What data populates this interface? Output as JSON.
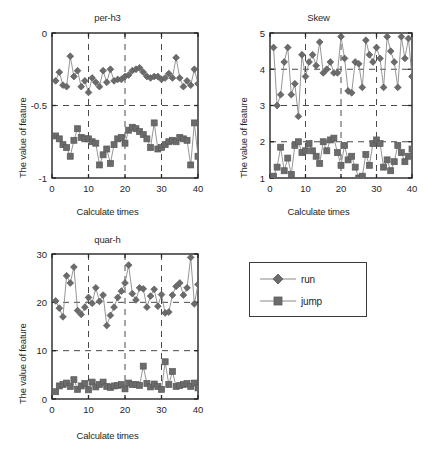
{
  "figure": {
    "background_color": "#ffffff",
    "series_color": "#6b6b6b",
    "line_color": "#8a8a8a",
    "axis_color": "#262626",
    "grid_color": "#4a4a4a"
  },
  "legend": {
    "name": "series-legend",
    "position": "bottom-right",
    "entries": [
      {
        "label": "run",
        "marker": "diamond-marker",
        "color": "#6b6b6b"
      },
      {
        "label": "jump",
        "marker": "square-marker",
        "color": "#6b6b6b"
      }
    ]
  },
  "chart_data": [
    {
      "type": "line",
      "panel": "per-h3",
      "title": "per-h3",
      "xlabel": "Calculate times",
      "ylabel": "The value of feature",
      "xlim": [
        0,
        40
      ],
      "ylim": [
        -1,
        0
      ],
      "xticks": [
        0,
        10,
        20,
        30,
        40
      ],
      "yticks": [
        0,
        -0.5,
        -1
      ],
      "xticklabels": [
        "0",
        "10",
        "20",
        "30",
        "40"
      ],
      "yticklabels": [
        "0",
        "-0.5",
        "-1"
      ],
      "grid": true,
      "grid_style": "dashed",
      "legend_position": "external",
      "x": [
        1,
        2,
        3,
        4,
        5,
        6,
        7,
        8,
        9,
        10,
        11,
        12,
        13,
        14,
        15,
        16,
        17,
        18,
        19,
        20,
        21,
        22,
        23,
        24,
        25,
        26,
        27,
        28,
        29,
        30,
        31,
        32,
        33,
        34,
        35,
        36,
        37,
        38,
        39,
        40
      ],
      "series": [
        {
          "name": "run",
          "marker": "diamond",
          "values": [
            -0.33,
            -0.27,
            -0.36,
            -0.37,
            -0.16,
            -0.3,
            -0.26,
            -0.37,
            -0.33,
            -0.41,
            -0.31,
            -0.34,
            -0.37,
            -0.26,
            -0.34,
            -0.25,
            -0.33,
            -0.32,
            -0.32,
            -0.3,
            -0.29,
            -0.26,
            -0.25,
            -0.24,
            -0.27,
            -0.3,
            -0.31,
            -0.3,
            -0.3,
            -0.32,
            -0.31,
            -0.28,
            -0.31,
            -0.17,
            -0.31,
            -0.37,
            -0.33,
            -0.36,
            -0.25,
            -0.35
          ]
        },
        {
          "name": "jump",
          "marker": "square",
          "values": [
            -0.71,
            -0.73,
            -0.77,
            -0.79,
            -0.85,
            -0.74,
            -0.66,
            -0.72,
            -0.73,
            -0.73,
            -0.75,
            -0.76,
            -0.91,
            -0.84,
            -0.8,
            -0.9,
            -0.77,
            -0.73,
            -0.72,
            -0.76,
            -0.67,
            -0.65,
            -0.66,
            -0.68,
            -0.7,
            -0.73,
            -0.79,
            -0.62,
            -0.8,
            -0.79,
            -0.77,
            -0.75,
            -0.74,
            -0.75,
            -0.72,
            -0.73,
            -0.74,
            -0.91,
            -0.62,
            -0.85
          ]
        }
      ]
    },
    {
      "type": "line",
      "panel": "Skew",
      "title": "Skew",
      "xlabel": "Calculate times",
      "ylabel": "The value of feature",
      "xlim": [
        0,
        40
      ],
      "ylim": [
        1,
        5
      ],
      "xticks": [
        0,
        10,
        20,
        30,
        40
      ],
      "yticks": [
        1,
        2,
        3,
        4,
        5
      ],
      "xticklabels": [
        "0",
        "10",
        "20",
        "30",
        "40"
      ],
      "yticklabels": [
        "1",
        "2",
        "3",
        "4",
        "5"
      ],
      "grid": true,
      "grid_style": "dashed",
      "legend_position": "external",
      "x": [
        1,
        2,
        3,
        4,
        5,
        6,
        7,
        8,
        9,
        10,
        11,
        12,
        13,
        14,
        15,
        16,
        17,
        18,
        19,
        20,
        21,
        22,
        23,
        24,
        25,
        26,
        27,
        28,
        29,
        30,
        31,
        32,
        33,
        34,
        35,
        36,
        37,
        38,
        39,
        40
      ],
      "series": [
        {
          "name": "run",
          "marker": "diamond",
          "values": [
            4.6,
            3.0,
            3.3,
            4.2,
            4.6,
            3.3,
            3.6,
            2.7,
            4.4,
            3.8,
            4.2,
            4.4,
            4.1,
            4.75,
            3.9,
            4.0,
            4.2,
            3.9,
            3.9,
            4.9,
            4.3,
            3.4,
            3.35,
            4.2,
            4.15,
            3.5,
            4.8,
            4.4,
            4.2,
            4.6,
            4.3,
            3.5,
            4.9,
            4.5,
            4.2,
            3.5,
            4.9,
            4.3,
            4.85,
            3.8
          ]
        },
        {
          "name": "jump",
          "marker": "square",
          "values": [
            1.05,
            1.3,
            1.85,
            1.2,
            1.55,
            1.1,
            1.9,
            2.0,
            1.7,
            1.75,
            1.95,
            1.75,
            1.6,
            1.4,
            2.0,
            1.75,
            2.05,
            2.1,
            1.7,
            1.35,
            1.9,
            1.5,
            1.6,
            1.3,
            1.0,
            1.05,
            1.65,
            1.35,
            1.95,
            2.05,
            1.95,
            1.3,
            1.5,
            1.2,
            1.45,
            1.9,
            1.7,
            1.45,
            1.6,
            1.8
          ]
        }
      ]
    },
    {
      "type": "line",
      "panel": "quar-h",
      "title": "quar-h",
      "xlabel": "Calculate times",
      "ylabel": "The value of feature",
      "xlim": [
        0,
        40
      ],
      "ylim": [
        0,
        30
      ],
      "xticks": [
        0,
        10,
        20,
        30,
        40
      ],
      "yticks": [
        0,
        10,
        20,
        30
      ],
      "xticklabels": [
        "0",
        "10",
        "20",
        "30",
        "40"
      ],
      "yticklabels": [
        "0",
        "10",
        "20",
        "30"
      ],
      "grid": true,
      "grid_style": "dashed",
      "legend_position": "external",
      "x": [
        1,
        2,
        3,
        4,
        5,
        6,
        7,
        8,
        9,
        10,
        11,
        12,
        13,
        14,
        15,
        16,
        17,
        18,
        19,
        20,
        21,
        22,
        23,
        24,
        25,
        26,
        27,
        28,
        29,
        30,
        31,
        32,
        33,
        34,
        35,
        36,
        37,
        38,
        39,
        40
      ],
      "series": [
        {
          "name": "run",
          "marker": "diamond",
          "values": [
            20.3,
            18.8,
            17.0,
            25.5,
            24.0,
            27.3,
            18.3,
            17.5,
            19.0,
            21.0,
            19.8,
            23.0,
            20.2,
            21.5,
            15.2,
            17.3,
            19.0,
            21.0,
            22.3,
            24.0,
            27.7,
            21.8,
            20.5,
            23.0,
            22.8,
            19.0,
            21.3,
            22.7,
            19.2,
            21.6,
            17.8,
            18.0,
            21.5,
            23.3,
            24.0,
            21.5,
            23.0,
            29.3,
            19.7,
            23.7
          ]
        },
        {
          "name": "jump",
          "marker": "square",
          "values": [
            1.5,
            2.7,
            3.0,
            3.3,
            2.6,
            4.0,
            2.0,
            2.7,
            3.2,
            1.9,
            3.5,
            2.5,
            3.0,
            3.5,
            2.6,
            2.4,
            2.7,
            2.8,
            3.0,
            2.1,
            3.3,
            3.0,
            3.0,
            2.8,
            6.8,
            3.2,
            2.5,
            3.1,
            2.6,
            2.0,
            7.7,
            3.0,
            5.7,
            2.6,
            2.8,
            3.0,
            3.2,
            2.6,
            3.3,
            2.3
          ]
        }
      ]
    }
  ]
}
